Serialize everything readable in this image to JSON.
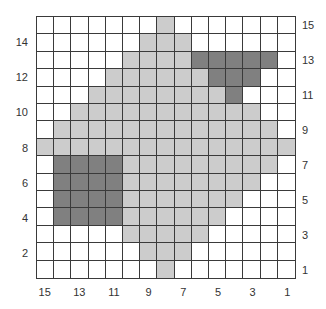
{
  "chart": {
    "rows": 15,
    "cols": 15,
    "colors": {
      "0": "#ffffff",
      "1": "#cccccc",
      "2": "#808080",
      "grid": "#3a3a3a"
    },
    "legend_values": {
      "0": "background",
      "1": "light-gray stitch",
      "2": "dark-gray stitch"
    },
    "grid_rows_top_to_bottom": [
      [
        0,
        0,
        0,
        0,
        0,
        0,
        0,
        1,
        0,
        0,
        0,
        0,
        0,
        0,
        0
      ],
      [
        0,
        0,
        0,
        0,
        0,
        0,
        1,
        1,
        1,
        0,
        0,
        0,
        0,
        0,
        0
      ],
      [
        0,
        0,
        0,
        0,
        0,
        1,
        1,
        1,
        1,
        2,
        2,
        2,
        2,
        2,
        0
      ],
      [
        0,
        0,
        0,
        0,
        1,
        1,
        1,
        1,
        1,
        1,
        2,
        2,
        2,
        0,
        0
      ],
      [
        0,
        0,
        0,
        1,
        1,
        1,
        1,
        1,
        1,
        1,
        1,
        2,
        0,
        0,
        0
      ],
      [
        0,
        0,
        1,
        1,
        1,
        1,
        1,
        1,
        1,
        1,
        1,
        1,
        1,
        0,
        0
      ],
      [
        0,
        1,
        1,
        1,
        1,
        1,
        1,
        1,
        1,
        1,
        1,
        1,
        1,
        1,
        0
      ],
      [
        1,
        1,
        1,
        1,
        1,
        1,
        1,
        1,
        1,
        1,
        1,
        1,
        1,
        1,
        1
      ],
      [
        0,
        2,
        2,
        2,
        2,
        1,
        1,
        1,
        1,
        1,
        1,
        1,
        1,
        1,
        0
      ],
      [
        0,
        2,
        2,
        2,
        2,
        1,
        1,
        1,
        1,
        1,
        1,
        1,
        1,
        0,
        0
      ],
      [
        0,
        2,
        2,
        2,
        2,
        1,
        1,
        1,
        1,
        1,
        1,
        1,
        0,
        0,
        0
      ],
      [
        0,
        2,
        2,
        2,
        2,
        1,
        1,
        1,
        1,
        1,
        1,
        0,
        0,
        0,
        0
      ],
      [
        0,
        0,
        0,
        0,
        0,
        1,
        1,
        1,
        1,
        1,
        0,
        0,
        0,
        0,
        0
      ],
      [
        0,
        0,
        0,
        0,
        0,
        0,
        1,
        1,
        1,
        0,
        0,
        0,
        0,
        0,
        0
      ],
      [
        0,
        0,
        0,
        0,
        0,
        0,
        0,
        1,
        0,
        0,
        0,
        0,
        0,
        0,
        0
      ]
    ],
    "left_labels": [
      "14",
      "12",
      "10",
      "8",
      "6",
      "4",
      "2"
    ],
    "right_labels": [
      "15",
      "13",
      "11",
      "9",
      "7",
      "5",
      "3",
      "1"
    ],
    "bottom_labels": [
      "15",
      "13",
      "11",
      "9",
      "7",
      "5",
      "3",
      "1"
    ]
  }
}
